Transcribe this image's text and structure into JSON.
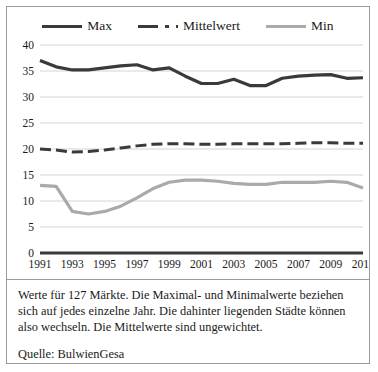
{
  "chart_data": {
    "type": "line",
    "title": "",
    "xlabel": "",
    "ylabel": "",
    "ylim": [
      0,
      40
    ],
    "ytick_step": 5,
    "grid": true,
    "legend_position": "top-center",
    "x": [
      1991,
      1992,
      1993,
      1994,
      1995,
      1996,
      1997,
      1998,
      1999,
      2000,
      2001,
      2002,
      2003,
      2004,
      2005,
      2006,
      2007,
      2008,
      2009,
      2010,
      2011
    ],
    "xtick_labels": [
      "1991",
      "1993",
      "1995",
      "1997",
      "1999",
      "2001",
      "2003",
      "2005",
      "2007",
      "2009",
      "2011"
    ],
    "ytick_labels": [
      "0",
      "5",
      "10",
      "15",
      "20",
      "25",
      "30",
      "35",
      "40"
    ],
    "series": [
      {
        "name": "Max",
        "style": "solid",
        "color": "#3a3a3a",
        "width": 3.2,
        "values": [
          37.0,
          35.8,
          35.2,
          35.2,
          35.6,
          36.0,
          36.2,
          35.2,
          35.6,
          34.0,
          32.6,
          32.6,
          33.4,
          32.2,
          32.2,
          33.6,
          34.0,
          34.2,
          34.3,
          33.6,
          33.7
        ]
      },
      {
        "name": "Mittelwert",
        "style": "dashed",
        "color": "#3a3a3a",
        "width": 3.0,
        "values": [
          20.0,
          19.8,
          19.4,
          19.5,
          19.8,
          20.2,
          20.6,
          20.9,
          21.0,
          21.0,
          20.9,
          20.9,
          21.0,
          21.0,
          21.0,
          21.0,
          21.1,
          21.2,
          21.2,
          21.1,
          21.1
        ]
      },
      {
        "name": "Min",
        "style": "solid",
        "color": "#aaaaaa",
        "width": 3.2,
        "values": [
          13.0,
          12.8,
          8.0,
          7.5,
          8.0,
          9.0,
          10.6,
          12.4,
          13.6,
          14.0,
          14.0,
          13.8,
          13.4,
          13.2,
          13.2,
          13.6,
          13.6,
          13.6,
          13.8,
          13.6,
          12.5
        ]
      }
    ]
  },
  "legend": {
    "entries": [
      {
        "label": "Max"
      },
      {
        "label": "Mittelwert"
      },
      {
        "label": "Min"
      }
    ]
  },
  "caption": {
    "body": "Werte für 127 Märkte. Die Maximal- und Minimalwerte beziehen sich auf jedes einzelne Jahr. Die dahinter liegenden Städte können also wechseln. Die Mittelwerte sind ungewichtet.",
    "source": "Quelle: BulwienGesa"
  }
}
